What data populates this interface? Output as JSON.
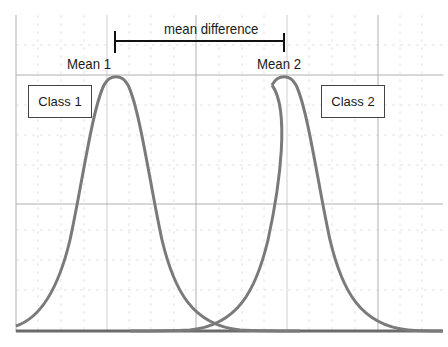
{
  "diagram": {
    "mean_difference_label": "mean difference",
    "mean1_label": "Mean 1",
    "mean2_label": "Mean 2",
    "class1_label": "Class 1",
    "class2_label": "Class 2",
    "colors": {
      "curve": "#7a7a7a",
      "baseline": "#666666",
      "grid_major": "#a0a0a0",
      "grid_minor": "#e2e2e2",
      "bracket": "#111111",
      "text": "#1a1a1a"
    }
  }
}
